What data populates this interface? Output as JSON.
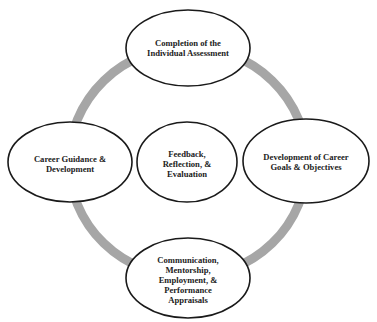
{
  "diagram": {
    "type": "cycle",
    "colors": {
      "ring": "#a6a6a6",
      "node_fill": "#ffffff",
      "node_stroke": "#1a1a1a",
      "text": "#222222",
      "background": "#ffffff"
    },
    "nodes": {
      "top": {
        "lines": [
          "Completion of the",
          "Individual Assessment"
        ]
      },
      "right": {
        "lines": [
          "Development of Career",
          "Goals & Objectives"
        ]
      },
      "bottom": {
        "lines": [
          "Communication,",
          "Mentorship,",
          "Employment, &",
          "Performance",
          "Appraisals"
        ]
      },
      "left": {
        "lines": [
          "Career Guidance &",
          "Development"
        ]
      },
      "center": {
        "lines": [
          "Feedback,",
          "Reflection, &",
          "Evaluation"
        ]
      }
    }
  }
}
